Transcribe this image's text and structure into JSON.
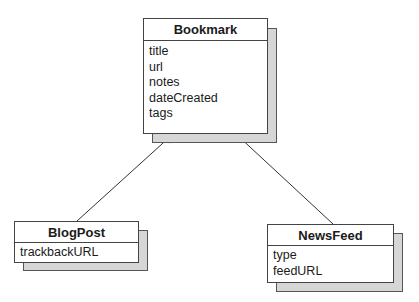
{
  "diagram": {
    "type": "UML class diagram",
    "classes": {
      "bookmark": {
        "name": "Bookmark",
        "attributes": [
          "title",
          "url",
          "notes",
          "dateCreated",
          "tags"
        ]
      },
      "blogpost": {
        "name": "BlogPost",
        "attributes": [
          "trackbackURL"
        ]
      },
      "newsfeed": {
        "name": "NewsFeed",
        "attributes": [
          "type",
          "feedURL"
        ]
      }
    },
    "relationships": [
      {
        "from": "BlogPost",
        "to": "Bookmark",
        "kind": "inheritance"
      },
      {
        "from": "NewsFeed",
        "to": "Bookmark",
        "kind": "inheritance"
      }
    ],
    "colors": {
      "shadow": "#d6d6d6",
      "border": "#444444",
      "line": "#333333"
    }
  }
}
